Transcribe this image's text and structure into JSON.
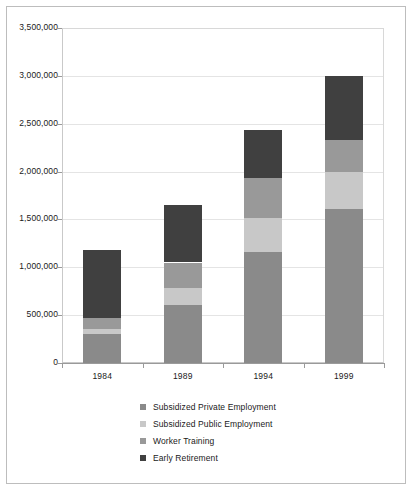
{
  "chart_data": {
    "type": "bar",
    "subtype": "stacked-bar",
    "title": "",
    "xlabel": "",
    "ylabel": "",
    "categories": [
      "1984",
      "1989",
      "1994",
      "1999"
    ],
    "ylim": [
      0,
      3500000
    ],
    "ytick_values": [
      0,
      500000,
      1000000,
      1500000,
      2000000,
      2500000,
      3000000,
      3500000
    ],
    "ytick_labels": [
      "0",
      "500,000",
      "1,000,000",
      "1,500,000",
      "2,000,000",
      "2,500,000",
      "3,000,000",
      "3,500,000"
    ],
    "grid": true,
    "legend_position": "bottom",
    "series": [
      {
        "name": "Subsidized Private Employment",
        "color": "#8a8a8a",
        "values": [
          300000,
          610000,
          1160000,
          1610000
        ]
      },
      {
        "name": "Subsidized Public Employment",
        "color": "#c8c8c8",
        "values": [
          60000,
          170000,
          350000,
          390000
        ]
      },
      {
        "name": "Worker Training",
        "color": "#999999",
        "values": [
          110000,
          270000,
          420000,
          330000
        ]
      },
      {
        "name": "Early Retirement",
        "color": "#404040",
        "values": [
          710000,
          600000,
          500000,
          670000
        ]
      }
    ],
    "totals": [
      1180000,
      1650000,
      2430000,
      3000000
    ]
  },
  "legend": {
    "items": [
      {
        "label": "Subsidized Private Employment",
        "color": "#8a8a8a"
      },
      {
        "label": "Subsidized Public Employment",
        "color": "#c8c8c8"
      },
      {
        "label": "Worker Training",
        "color": "#999999"
      },
      {
        "label": "Early Retirement",
        "color": "#404040"
      }
    ]
  }
}
